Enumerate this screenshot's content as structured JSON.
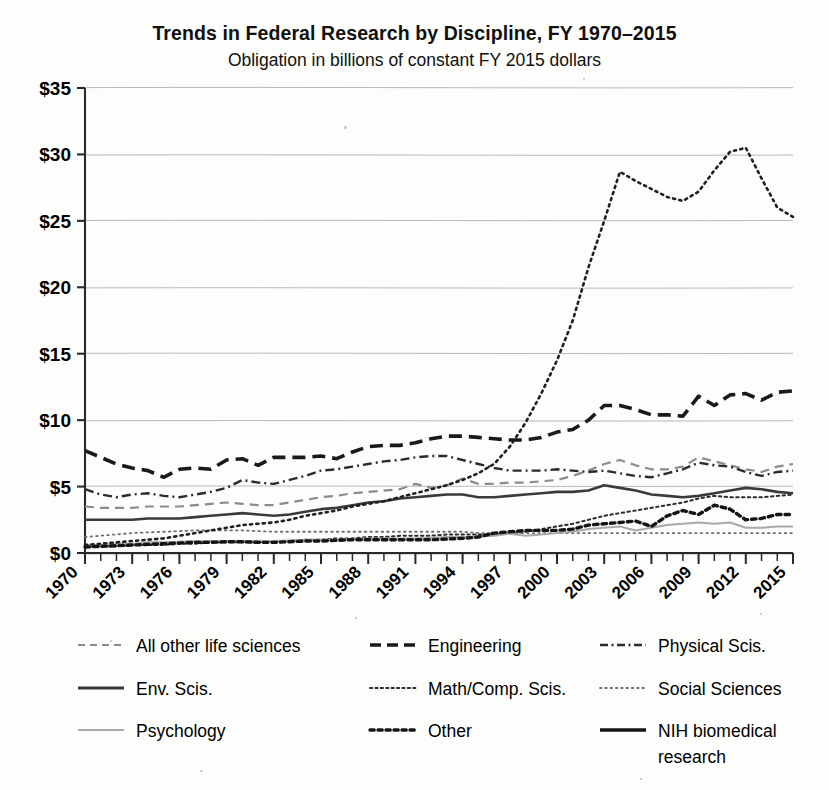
{
  "chart_data": {
    "type": "line",
    "title": "Trends in Federal Research by Discipline, FY 1970–2015",
    "subtitle": "Obligation in billions of constant FY 2015 dollars",
    "xlabel": "",
    "ylabel": "",
    "xlim": [
      1970,
      2015
    ],
    "ylim": [
      0,
      35
    ],
    "ytick_labels": [
      "$0",
      "$5",
      "$10",
      "$15",
      "$20",
      "$25",
      "$30",
      "$35"
    ],
    "ytick_values": [
      0,
      5,
      10,
      15,
      20,
      25,
      30,
      35
    ],
    "xtick_labels": [
      "1970",
      "1973",
      "1976",
      "1979",
      "1982",
      "1985",
      "1988",
      "1991",
      "1994",
      "1997",
      "2000",
      "2003",
      "2006",
      "2009",
      "2012",
      "2015"
    ],
    "xtick_values": [
      1970,
      1973,
      1976,
      1979,
      1982,
      1985,
      1988,
      1991,
      1994,
      1997,
      2000,
      2003,
      2006,
      2009,
      2012,
      2015
    ],
    "xtick_rotation": 45,
    "grid": "horizontal",
    "legend_position": "below",
    "x": [
      1970,
      1971,
      1972,
      1973,
      1974,
      1975,
      1976,
      1977,
      1978,
      1979,
      1980,
      1981,
      1982,
      1983,
      1984,
      1985,
      1986,
      1987,
      1988,
      1989,
      1990,
      1991,
      1992,
      1993,
      1994,
      1995,
      1996,
      1997,
      1998,
      1999,
      2000,
      2001,
      2002,
      2003,
      2004,
      2005,
      2006,
      2007,
      2008,
      2009,
      2010,
      2011,
      2012,
      2013,
      2014,
      2015
    ],
    "series": [
      {
        "name": "All other life sciences",
        "style": "dashed",
        "color": "#8b8b8b",
        "width": 2.2,
        "values": [
          3.5,
          3.4,
          3.4,
          3.4,
          3.5,
          3.5,
          3.5,
          3.6,
          3.7,
          3.8,
          3.7,
          3.6,
          3.6,
          3.8,
          4.0,
          4.2,
          4.3,
          4.5,
          4.6,
          4.7,
          4.8,
          5.2,
          4.9,
          5.1,
          5.6,
          5.2,
          5.2,
          5.3,
          5.3,
          5.4,
          5.5,
          5.8,
          6.2,
          6.7,
          7.0,
          6.6,
          6.3,
          6.3,
          6.5,
          7.2,
          6.9,
          6.6,
          6.3,
          6.1,
          6.5,
          6.7
        ]
      },
      {
        "name": "Engineering",
        "style": "dashed-bold",
        "color": "#1a1a1a",
        "width": 3.6,
        "values": [
          7.7,
          7.2,
          6.7,
          6.4,
          6.2,
          5.7,
          6.3,
          6.4,
          6.3,
          7.0,
          7.1,
          6.6,
          7.2,
          7.2,
          7.2,
          7.3,
          7.1,
          7.6,
          8.0,
          8.1,
          8.1,
          8.3,
          8.6,
          8.8,
          8.8,
          8.7,
          8.6,
          8.5,
          8.5,
          8.7,
          9.1,
          9.3,
          10.0,
          11.1,
          11.1,
          10.8,
          10.4,
          10.4,
          10.3,
          11.8,
          11.1,
          11.9,
          12.0,
          11.5,
          12.1,
          12.2
        ]
      },
      {
        "name": "Physical Scis.",
        "style": "dash-dot",
        "color": "#2b2b2b",
        "width": 2.4,
        "values": [
          4.8,
          4.4,
          4.2,
          4.4,
          4.5,
          4.3,
          4.2,
          4.4,
          4.6,
          4.9,
          5.5,
          5.3,
          5.2,
          5.5,
          5.8,
          6.2,
          6.3,
          6.5,
          6.7,
          6.9,
          7.0,
          7.2,
          7.3,
          7.3,
          7.0,
          6.7,
          6.4,
          6.2,
          6.2,
          6.2,
          6.3,
          6.2,
          6.1,
          6.2,
          6.0,
          5.8,
          5.7,
          6.0,
          6.3,
          6.8,
          6.6,
          6.5,
          6.1,
          5.8,
          6.1,
          6.2
        ]
      },
      {
        "name": "Env. Scis.",
        "style": "solid",
        "color": "#3a3a3a",
        "width": 2.6,
        "values": [
          2.5,
          2.5,
          2.5,
          2.5,
          2.6,
          2.6,
          2.6,
          2.7,
          2.8,
          2.9,
          3.0,
          2.9,
          2.8,
          2.9,
          3.1,
          3.3,
          3.4,
          3.6,
          3.8,
          3.9,
          4.1,
          4.2,
          4.3,
          4.4,
          4.4,
          4.2,
          4.2,
          4.3,
          4.4,
          4.5,
          4.6,
          4.6,
          4.7,
          5.1,
          4.9,
          4.7,
          4.4,
          4.3,
          4.2,
          4.3,
          4.5,
          4.7,
          4.9,
          4.8,
          4.6,
          4.5
        ]
      },
      {
        "name": "Math/Comp. Scis.",
        "style": "dotted-fine",
        "color": "#2b2b2b",
        "width": 2.0,
        "values": [
          0.5,
          0.5,
          0.5,
          0.6,
          0.6,
          0.6,
          0.7,
          0.7,
          0.8,
          0.8,
          0.8,
          0.8,
          0.9,
          0.9,
          1.0,
          1.0,
          1.1,
          1.1,
          1.2,
          1.2,
          1.3,
          1.3,
          1.3,
          1.4,
          1.4,
          1.4,
          1.4,
          1.5,
          1.6,
          1.8,
          2.0,
          2.2,
          2.5,
          2.8,
          3.0,
          3.2,
          3.4,
          3.6,
          3.8,
          4.1,
          4.3,
          4.2,
          4.2,
          4.2,
          4.3,
          4.4
        ]
      },
      {
        "name": "Social Sciences",
        "style": "dotted-tiny",
        "color": "#6e6e6e",
        "width": 1.8,
        "values": [
          1.2,
          1.3,
          1.4,
          1.5,
          1.55,
          1.6,
          1.65,
          1.7,
          1.7,
          1.7,
          1.7,
          1.65,
          1.6,
          1.6,
          1.6,
          1.6,
          1.6,
          1.6,
          1.6,
          1.6,
          1.6,
          1.6,
          1.6,
          1.6,
          1.6,
          1.5,
          1.5,
          1.5,
          1.5,
          1.5,
          1.5,
          1.5,
          1.5,
          1.5,
          1.5,
          1.5,
          1.5,
          1.5,
          1.5,
          1.5,
          1.5,
          1.5,
          1.5,
          1.5,
          1.5,
          1.5
        ]
      },
      {
        "name": "Psychology",
        "style": "solid-light",
        "color": "#a9a9a9",
        "width": 2.0,
        "values": [
          0.6,
          0.6,
          0.7,
          0.7,
          0.8,
          0.8,
          0.85,
          0.9,
          0.9,
          0.9,
          0.9,
          0.9,
          0.9,
          0.95,
          1.0,
          1.0,
          1.0,
          1.05,
          1.1,
          1.1,
          1.1,
          1.1,
          1.15,
          1.2,
          1.2,
          1.25,
          1.3,
          1.45,
          1.3,
          1.4,
          1.5,
          1.6,
          1.8,
          1.9,
          2.0,
          1.7,
          1.9,
          2.1,
          2.2,
          2.3,
          2.2,
          2.3,
          1.9,
          1.9,
          2.0,
          2.0
        ]
      },
      {
        "name": "Other",
        "style": "dotted-bold",
        "color": "#141414",
        "width": 3.4,
        "values": [
          0.45,
          0.5,
          0.55,
          0.6,
          0.65,
          0.7,
          0.75,
          0.8,
          0.8,
          0.85,
          0.85,
          0.8,
          0.8,
          0.85,
          0.9,
          0.9,
          0.95,
          1.0,
          1.0,
          1.0,
          1.0,
          1.0,
          1.0,
          1.05,
          1.1,
          1.2,
          1.5,
          1.6,
          1.7,
          1.7,
          1.7,
          1.8,
          2.1,
          2.2,
          2.3,
          2.4,
          2.0,
          2.8,
          3.2,
          2.9,
          3.6,
          3.3,
          2.5,
          2.6,
          2.9,
          2.9
        ]
      },
      {
        "name": "NIH biomedical research",
        "style": "dotted-nih",
        "color": "#202020",
        "width": 2.6,
        "values": [
          0.6,
          0.7,
          0.8,
          0.9,
          1.0,
          1.1,
          1.3,
          1.5,
          1.7,
          1.9,
          2.1,
          2.2,
          2.3,
          2.5,
          2.8,
          3.0,
          3.2,
          3.5,
          3.7,
          3.9,
          4.2,
          4.5,
          4.8,
          5.1,
          5.5,
          6.0,
          6.7,
          8.0,
          9.8,
          12.0,
          14.5,
          17.5,
          21.5,
          25.0,
          28.7,
          28.0,
          27.4,
          26.8,
          26.5,
          27.2,
          28.8,
          30.2,
          30.5,
          28.2,
          26.0,
          25.3
        ]
      }
    ],
    "legend": [
      {
        "label": "All other life sciences",
        "style": "dashed",
        "color": "#8b8b8b"
      },
      {
        "label": "Engineering",
        "style": "dashed-bold",
        "color": "#1a1a1a"
      },
      {
        "label": "Physical Scis.",
        "style": "dash-dot",
        "color": "#2b2b2b"
      },
      {
        "label": "Env. Scis.",
        "style": "solid",
        "color": "#3a3a3a"
      },
      {
        "label": "Math/Comp. Scis.",
        "style": "dotted-fine",
        "color": "#2b2b2b"
      },
      {
        "label": "Social Sciences",
        "style": "dotted-tiny",
        "color": "#6e6e6e"
      },
      {
        "label": "Psychology",
        "style": "solid-light",
        "color": "#a9a9a9"
      },
      {
        "label": "Other",
        "style": "dotted-bold",
        "color": "#141414"
      },
      {
        "label": "NIH biomedical research",
        "style": "solid-bold",
        "color": "#141414"
      }
    ]
  }
}
